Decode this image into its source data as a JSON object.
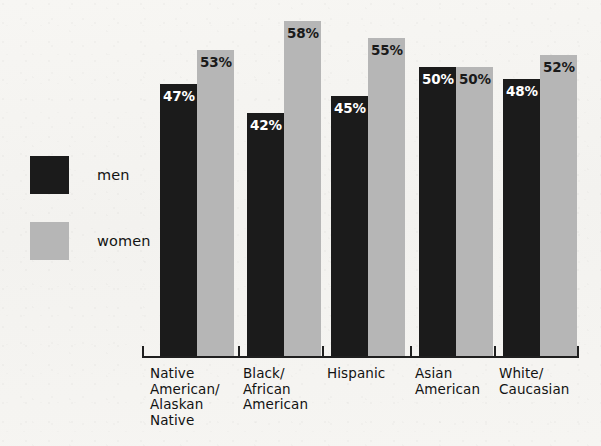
{
  "chart_data": {
    "type": "bar",
    "title": "",
    "subtitle": "",
    "xlabel": "",
    "ylabel": "",
    "ylim": [
      0,
      60
    ],
    "grid": false,
    "legend_position": "left",
    "categories": [
      "Native\nAmerican/\nAlaskan\nNative",
      "Black/\nAfrican\nAmerican",
      "Hispanic",
      "Asian\nAmerican",
      "White/\nCaucasian"
    ],
    "series": [
      {
        "name": "men",
        "color": "#1b1b1b",
        "values": [
          47,
          42,
          45,
          50,
          48
        ],
        "labels": [
          "47%",
          "42%",
          "45%",
          "50%",
          "48%"
        ]
      },
      {
        "name": "women",
        "color": "#b6b6b6",
        "values": [
          53,
          58,
          55,
          50,
          52
        ],
        "labels": [
          "53%",
          "58%",
          "55%",
          "50%",
          "52%"
        ]
      }
    ]
  },
  "legend": {
    "items": [
      {
        "label": "men",
        "color": "#1b1b1b"
      },
      {
        "label": "women",
        "color": "#b6b6b6"
      }
    ]
  },
  "colors": {
    "background": "#f5f4f1",
    "men": "#1b1b1b",
    "women": "#b6b6b6",
    "axis": "#1f1f1f",
    "text": "#121212"
  }
}
